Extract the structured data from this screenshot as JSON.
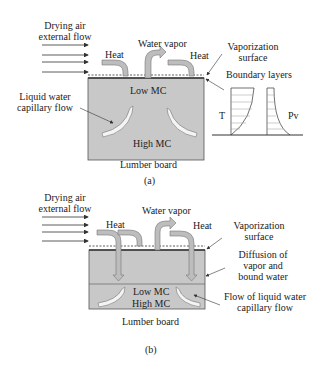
{
  "panel_a": {
    "drying_air": [
      "Drying air",
      "external flow"
    ],
    "water_vapor": "Water vapor",
    "heat_left": "Heat",
    "heat_right": "Heat",
    "vaporization_surface": [
      "Vaporization",
      "surface"
    ],
    "boundary_layers": "Boundary layers",
    "liquid_water": [
      "Liquid water",
      "capillary flow"
    ],
    "low_mc": "Low MC",
    "high_mc": "High MC",
    "board": "Lumber board",
    "caption": "(a)",
    "graph_t": "T",
    "graph_pv": "Pv"
  },
  "panel_b": {
    "drying_air": [
      "Drying air",
      "external flow"
    ],
    "water_vapor": "Water vapor",
    "heat_left": "Heat",
    "heat_right": "Heat",
    "vaporization_surface": [
      "Vaporization",
      "surface"
    ],
    "diffusion": [
      "Diffusion of",
      "vapor and",
      "bound water"
    ],
    "flow_liquid": [
      "Flow of liquid water",
      "capillary flow"
    ],
    "low_mc": "Low MC",
    "high_mc": "High MC",
    "board": "Lumber board",
    "caption": "(b)"
  },
  "colors": {
    "board_fill": "#c8c8c8",
    "arrow_fill": "#bdbdbd",
    "line": "#333333"
  }
}
